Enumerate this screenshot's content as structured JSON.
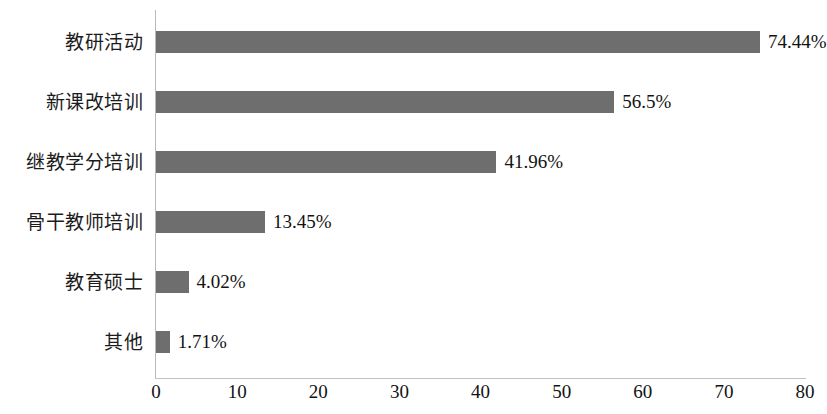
{
  "chart_data": {
    "type": "bar",
    "orientation": "horizontal",
    "title": "",
    "subtitle": "",
    "xlabel": "",
    "ylabel": "",
    "categories": [
      "教研活动",
      "新课改培训",
      "继教学分培训",
      "骨干教师培训",
      "教育硕士",
      "其他"
    ],
    "values": [
      74.44,
      56.5,
      41.96,
      13.45,
      4.02,
      1.71
    ],
    "value_labels": [
      "74.44%",
      "56.5%",
      "41.96%",
      "13.45%",
      "4.02%",
      "1.71%"
    ],
    "xlim": [
      0,
      80
    ],
    "xticks": [
      0,
      10,
      20,
      30,
      40,
      50,
      60,
      70,
      80
    ],
    "xtick_labels": [
      "0",
      "10",
      "20",
      "30",
      "40",
      "50",
      "60",
      "70",
      "80"
    ],
    "grid": false,
    "legend": false,
    "legend_position": "none",
    "bar_color": "#6e6e6e",
    "axis_color": "#b9b9b9",
    "background_color": "#ffffff",
    "text_color": "#121212"
  }
}
